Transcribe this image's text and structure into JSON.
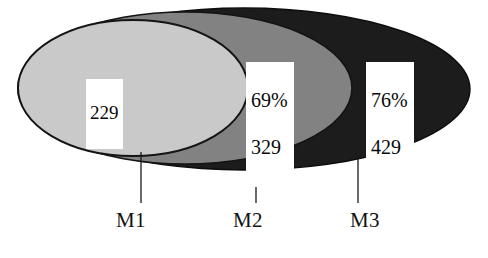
{
  "figure": {
    "kind": "nested-ellipse-venn",
    "background_color": "#ffffff",
    "outline_color": "#111111"
  },
  "sets": [
    {
      "id": "M1",
      "label": "M1",
      "fill_color": "#c9c9c9",
      "percent": "",
      "count": "229",
      "value_text": "229"
    },
    {
      "id": "M2",
      "label": "M2",
      "fill_color": "#828282",
      "percent": "69%",
      "count": "329",
      "value_text": "69%\n329"
    },
    {
      "id": "M3",
      "label": "M3",
      "fill_color": "#1c1c1c",
      "percent": "76%",
      "count": "429",
      "value_text": "76%\n429"
    }
  ],
  "labels": {
    "m1": "M1",
    "m2": "M2",
    "m3": "M3"
  },
  "values": {
    "m1_count": "229",
    "m2_percent": "69%",
    "m2_count": "329",
    "m3_percent": "76%",
    "m3_count": "429"
  }
}
